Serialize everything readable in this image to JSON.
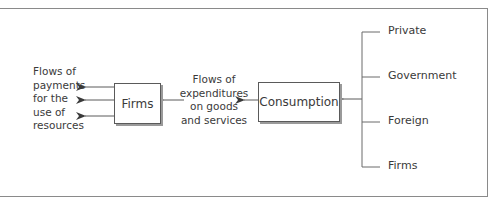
{
  "diagram": {
    "left_label_lines": [
      "Flows of",
      "payments",
      "for the",
      "use of",
      "resources"
    ],
    "firms_box_label": "Firms",
    "middle_label_lines": [
      "Flows of",
      "expenditures",
      "on goods",
      "and services"
    ],
    "consumption_box_label": "Consumption",
    "sources": [
      "Private",
      "Government",
      "Foreign",
      "Firms"
    ]
  }
}
